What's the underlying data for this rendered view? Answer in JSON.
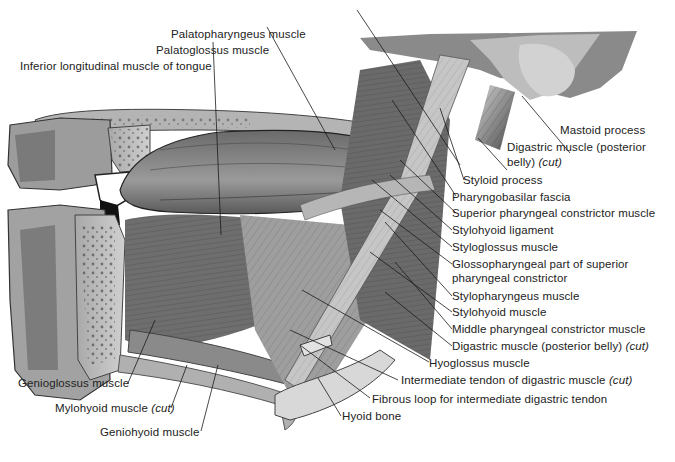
{
  "figure": {
    "type": "anatomical-illustration",
    "palette": {
      "ink": "#222222",
      "bone": "#b8b8b8",
      "muscle_dark": "#4a4a4a",
      "muscle_mid": "#8a8a8a",
      "muscle_light": "#cfcfcf",
      "background": "#ffffff"
    },
    "labels": [
      {
        "id": "palatopharyngeus",
        "text": "Palatopharyngeus muscle"
      },
      {
        "id": "palatoglossus",
        "text": "Palatoglossus muscle"
      },
      {
        "id": "inferior-longitudinal",
        "text": "Inferior longitudinal muscle of tongue"
      },
      {
        "id": "mastoid",
        "text": "Mastoid process"
      },
      {
        "id": "digastric-posterior-1",
        "text": "Digastric muscle (posterior"
      },
      {
        "id": "digastric-posterior-2",
        "text": "belly) ",
        "italic": "(cut)"
      },
      {
        "id": "styloid",
        "text": "Styloid process"
      },
      {
        "id": "pharyngobasilar",
        "text": "Pharyngobasilar fascia"
      },
      {
        "id": "superior-constrictor",
        "text": "Superior pharyngeal constrictor muscle"
      },
      {
        "id": "stylohyoid-ligament",
        "text": "Stylohyoid ligament"
      },
      {
        "id": "styloglossus",
        "text": "Styloglossus muscle"
      },
      {
        "id": "glossopharyngeal-1",
        "text": "Glossopharyngeal part of superior"
      },
      {
        "id": "glossopharyngeal-2",
        "text": "pharyngeal constrictor"
      },
      {
        "id": "stylopharyngeus",
        "text": "Stylopharyngeus muscle"
      },
      {
        "id": "stylohyoid-muscle",
        "text": "Stylohyoid muscle"
      },
      {
        "id": "middle-constrictor",
        "text": "Middle pharyngeal constrictor muscle"
      },
      {
        "id": "digastric-posterior-cut",
        "text": "Digastric muscle (posterior belly) ",
        "italic": "(cut)"
      },
      {
        "id": "hyoglossus",
        "text": "Hyoglossus muscle"
      },
      {
        "id": "intermediate-tendon",
        "text": "Intermediate tendon of digastric muscle ",
        "italic": "(cut)"
      },
      {
        "id": "fibrous-loop",
        "text": "Fibrous loop for intermediate digastric tendon"
      },
      {
        "id": "hyoid",
        "text": "Hyoid bone"
      },
      {
        "id": "genioglossus",
        "text": "Genioglossus muscle"
      },
      {
        "id": "mylohyoid",
        "text": "Mylohyoid muscle ",
        "italic": "(cut)"
      },
      {
        "id": "geniohyoid",
        "text": "Geniohyoid muscle"
      }
    ]
  }
}
